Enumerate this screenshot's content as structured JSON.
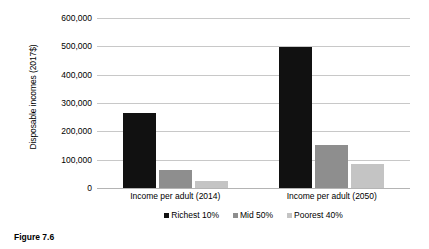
{
  "caption": "Figure 7.6",
  "chart_data": {
    "type": "bar",
    "title": "",
    "subtitle": "",
    "xlabel": "",
    "ylabel": "Disposable incomes (2017$)",
    "categories": [
      "Income per adult (2014)",
      "Income per adult (2050)"
    ],
    "series": [
      {
        "name": "Richest 10%",
        "color": "#111111",
        "values": [
          265000,
          497000
        ]
      },
      {
        "name": "Mid 50%",
        "color": "#8e8e8e",
        "values": [
          65000,
          152000
        ]
      },
      {
        "name": "Poorest 40%",
        "color": "#c4c4c4",
        "values": [
          25000,
          85000
        ]
      }
    ],
    "ylim": [
      0,
      600000
    ],
    "yticks": [
      0,
      100000,
      200000,
      300000,
      400000,
      500000,
      600000
    ],
    "ytick_labels": [
      "0",
      "100,000",
      "200,000",
      "300,000",
      "400,000",
      "500,000",
      "600,000"
    ],
    "grid": true,
    "grid_axis": "y",
    "legend_position": "bottom",
    "gridline_color": "#c8c8c8",
    "background_color": "#ffffff"
  }
}
